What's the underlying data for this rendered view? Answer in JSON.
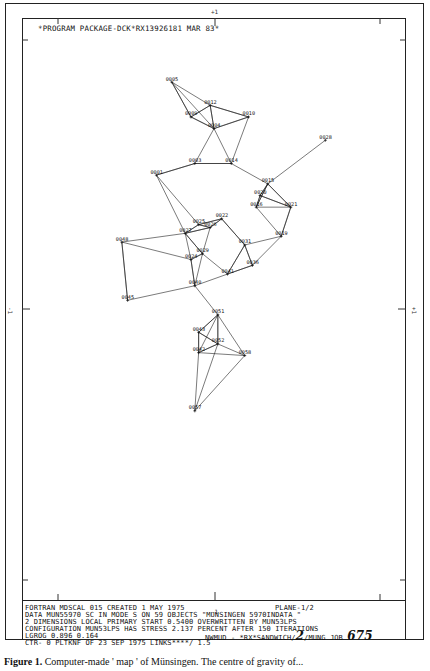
{
  "header": {
    "program_line": "*PROGRAM PACKAGE-DCK*RX13926181 MAR 83*"
  },
  "axis_marks": {
    "top": "+1",
    "bottom": "-1",
    "left": "-1",
    "right": "+1"
  },
  "info": {
    "line1": "FORTRAN MDSCAL 015 CREATED 1 MAY 1975",
    "line1_right": "PLANE-1/2",
    "line2": "DATA MUN55970 SC IN MODE S ON   59 OBJECTS  \"MUNSINGEN   5970INDATA \"",
    "line3": "2 DIMENSIONS LOCAL   PRIMARY    START 0.5400 OVERWRITTEN BY MUN53LPS",
    "line4": "CONFIGURATION MUN53LPS HAS STRESS   2.137 PERCENT AFTER 150 ITERATIONS",
    "line5_left": "LGROG   0.896  0.164",
    "line5_right": "NWMUD - *RX*SANDWICH/",
    "line5_hand1": "2",
    "line5_mid": "/MUNG JOB",
    "line5_hand2": "675",
    "line6": "CTR- 0 PLTKNF OF 23 SEP 1975 LINKS****/ 1.5"
  },
  "caption": {
    "label": "Figure 1.",
    "text": "Computer-made ' map ' of Münsingen. The centre of gravity of..."
  },
  "chart_data": {
    "type": "scatter",
    "xlabel": "",
    "ylabel": "",
    "xlim": [
      -1,
      1
    ],
    "ylim": [
      -1,
      1
    ],
    "grid": false,
    "legend": null,
    "points": [
      {
        "id": "0005",
        "x": -0.22,
        "y": 0.78
      },
      {
        "id": "0012",
        "x": -0.02,
        "y": 0.7
      },
      {
        "id": "0010",
        "x": 0.18,
        "y": 0.66
      },
      {
        "id": "0009",
        "x": -0.12,
        "y": 0.66
      },
      {
        "id": "0004",
        "x": 0.0,
        "y": 0.62
      },
      {
        "id": "0014",
        "x": 0.09,
        "y": 0.5
      },
      {
        "id": "0003",
        "x": -0.1,
        "y": 0.5
      },
      {
        "id": "0001",
        "x": -0.3,
        "y": 0.46
      },
      {
        "id": "0028",
        "x": 0.58,
        "y": 0.58
      },
      {
        "id": "0015",
        "x": 0.28,
        "y": 0.43
      },
      {
        "id": "0020",
        "x": 0.24,
        "y": 0.39
      },
      {
        "id": "0016",
        "x": 0.22,
        "y": 0.35
      },
      {
        "id": "0021",
        "x": 0.4,
        "y": 0.35
      },
      {
        "id": "0022",
        "x": 0.04,
        "y": 0.31
      },
      {
        "id": "0025",
        "x": -0.08,
        "y": 0.29
      },
      {
        "id": "0026",
        "x": -0.02,
        "y": 0.28
      },
      {
        "id": "0027",
        "x": -0.15,
        "y": 0.26
      },
      {
        "id": "0048",
        "x": -0.48,
        "y": 0.23
      },
      {
        "id": "0019",
        "x": 0.35,
        "y": 0.25
      },
      {
        "id": "0031",
        "x": 0.16,
        "y": 0.22
      },
      {
        "id": "0029",
        "x": -0.06,
        "y": 0.19
      },
      {
        "id": "0024",
        "x": -0.12,
        "y": 0.17
      },
      {
        "id": "0036",
        "x": 0.2,
        "y": 0.15
      },
      {
        "id": "0041",
        "x": 0.07,
        "y": 0.12
      },
      {
        "id": "0040",
        "x": -0.1,
        "y": 0.08
      },
      {
        "id": "0045",
        "x": -0.45,
        "y": 0.03
      },
      {
        "id": "0051",
        "x": 0.02,
        "y": -0.02
      },
      {
        "id": "0043",
        "x": -0.08,
        "y": -0.08
      },
      {
        "id": "0052",
        "x": 0.02,
        "y": -0.12
      },
      {
        "id": "0042",
        "x": -0.08,
        "y": -0.15
      },
      {
        "id": "0058",
        "x": 0.16,
        "y": -0.16
      },
      {
        "id": "0057",
        "x": -0.1,
        "y": -0.35
      }
    ],
    "annotations": [
      "Points labelled with 4-digit grave numbers",
      "Line segments link nearest neighbours"
    ]
  }
}
